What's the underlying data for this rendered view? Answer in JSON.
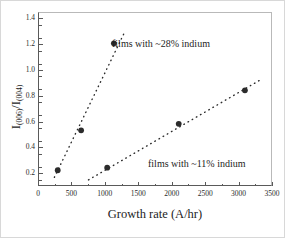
{
  "figure": {
    "background": "#ffffff",
    "frame_color": "#5a5a5a"
  },
  "axes": {
    "x_title": "Growth rate (A/hr)",
    "y_title_main": "I",
    "y_title_sub1": "(006)",
    "y_title_mid": "/I",
    "y_title_sub2": "(004)",
    "x_ticks": [
      "0",
      "500",
      "1000",
      "1500",
      "2000",
      "2500",
      "3000",
      "3500"
    ],
    "y_ticks": [
      "0.2",
      "0.4",
      "0.6",
      "0.8",
      "1.0",
      "1.2",
      "1.4"
    ]
  },
  "annotations": {
    "series_28": "films with ~28% indium",
    "series_11": "films with ~11% indium"
  },
  "chart_data": {
    "type": "scatter",
    "title": "",
    "xlabel": "Growth rate (A/hr)",
    "ylabel": "I(006)/I(004)",
    "xlim": [
      0,
      3500
    ],
    "ylim": [
      0.1,
      1.45
    ],
    "xtick_values": [
      0,
      500,
      1000,
      1500,
      2000,
      2500,
      3000,
      3500
    ],
    "ytick_values": [
      0.2,
      0.4,
      0.6,
      0.8,
      1.0,
      1.2,
      1.4
    ],
    "x_minor_step": 250,
    "y_minor_step": 0.1,
    "grid": false,
    "legend": "none (in-plot text annotations)",
    "marker_color": "#2b2b2b",
    "trendline_style": "dotted",
    "series": [
      {
        "name": "films with ~28% indium",
        "points": [
          {
            "x": 280,
            "y": 0.23
          },
          {
            "x": 630,
            "y": 0.54
          },
          {
            "x": 1120,
            "y": 1.215
          }
        ],
        "trendline": {
          "x_start": 230,
          "y_start": 0.175,
          "x_end": 1270,
          "y_end": 1.29
        }
      },
      {
        "name": "films with ~11% indium",
        "points": [
          {
            "x": 1020,
            "y": 0.25
          },
          {
            "x": 2090,
            "y": 0.59
          },
          {
            "x": 3080,
            "y": 0.85
          }
        ],
        "trendline": {
          "x_start": 740,
          "y_start": 0.155,
          "x_end": 3340,
          "y_end": 0.94
        }
      }
    ]
  }
}
